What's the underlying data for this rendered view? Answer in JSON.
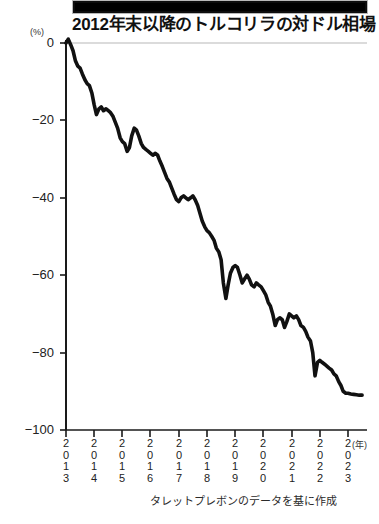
{
  "banner": {
    "name": "black-headline-bar"
  },
  "header": {
    "title": "2012年末以降のトルコリラの対ドル相場"
  },
  "footer": {
    "source_note": "タレットプレボンのデータを基に作成"
  },
  "axis": {
    "unit_label": "(%)",
    "x_unit_label": "(年)"
  },
  "chart_data": {
    "type": "line",
    "title": "2012年末以降のトルコリラの対ドル相場",
    "subtitle": "",
    "xlabel": "(年)",
    "ylabel": "(%)",
    "ylim": [
      -100,
      0
    ],
    "xlim": [
      2013,
      2023.6
    ],
    "grid": "zero-line-only",
    "legend": "none",
    "line_color": "#111111",
    "line_width_px": 3.6,
    "y_ticks": [
      0,
      -20,
      -40,
      -60,
      -80,
      -100
    ],
    "y_tick_labels": [
      "0",
      "−20",
      "−40",
      "−60",
      "−80",
      "−100"
    ],
    "x_ticks": [
      2013,
      2014,
      2015,
      2016,
      2017,
      2018,
      2019,
      2020,
      2021,
      2022,
      2023
    ],
    "x_tick_labels": [
      "2013",
      "2014",
      "2015",
      "2016",
      "2017",
      "2018",
      "2019",
      "2020",
      "2021",
      "2022",
      "2023"
    ],
    "series": [
      {
        "name": "トルコリラ対ドル相場（2012年末比）",
        "x": [
          2013.0,
          2013.08,
          2013.17,
          2013.25,
          2013.33,
          2013.42,
          2013.5,
          2013.58,
          2013.67,
          2013.75,
          2013.83,
          2013.92,
          2014.0,
          2014.08,
          2014.17,
          2014.25,
          2014.33,
          2014.42,
          2014.5,
          2014.58,
          2014.67,
          2014.75,
          2014.83,
          2014.92,
          2015.0,
          2015.08,
          2015.17,
          2015.25,
          2015.33,
          2015.42,
          2015.5,
          2015.58,
          2015.67,
          2015.75,
          2015.83,
          2015.92,
          2016.0,
          2016.08,
          2016.17,
          2016.25,
          2016.33,
          2016.42,
          2016.5,
          2016.58,
          2016.67,
          2016.75,
          2016.83,
          2016.92,
          2017.0,
          2017.08,
          2017.17,
          2017.25,
          2017.33,
          2017.42,
          2017.5,
          2017.58,
          2017.67,
          2017.75,
          2017.83,
          2017.92,
          2018.0,
          2018.08,
          2018.17,
          2018.25,
          2018.33,
          2018.42,
          2018.5,
          2018.58,
          2018.67,
          2018.75,
          2018.83,
          2018.92,
          2019.0,
          2019.08,
          2019.17,
          2019.25,
          2019.33,
          2019.42,
          2019.5,
          2019.58,
          2019.67,
          2019.75,
          2019.83,
          2019.92,
          2020.0,
          2020.08,
          2020.17,
          2020.25,
          2020.33,
          2020.42,
          2020.5,
          2020.58,
          2020.67,
          2020.75,
          2020.83,
          2020.92,
          2021.0,
          2021.08,
          2021.17,
          2021.25,
          2021.33,
          2021.42,
          2021.5,
          2021.58,
          2021.67,
          2021.75,
          2021.83,
          2021.92,
          2022.0,
          2022.08,
          2022.17,
          2022.25,
          2022.33,
          2022.42,
          2022.5,
          2022.58,
          2022.67,
          2022.75,
          2022.83,
          2022.92,
          2023.0,
          2023.1,
          2023.2,
          2023.3,
          2023.4,
          2023.5
        ],
        "values": [
          0.0,
          1.0,
          -0.5,
          -2.0,
          -4.5,
          -6.0,
          -6.5,
          -8.0,
          -9.5,
          -10.5,
          -11.0,
          -13.0,
          -16.0,
          -18.5,
          -17.0,
          -16.5,
          -17.5,
          -17.0,
          -17.5,
          -18.0,
          -19.0,
          -20.5,
          -22.0,
          -24.5,
          -25.5,
          -26.0,
          -28.0,
          -27.0,
          -24.0,
          -22.0,
          -22.5,
          -24.0,
          -26.0,
          -27.0,
          -27.5,
          -28.0,
          -28.5,
          -29.0,
          -28.5,
          -29.0,
          -30.5,
          -32.0,
          -33.5,
          -35.0,
          -36.0,
          -37.5,
          -39.0,
          -40.5,
          -41.0,
          -40.0,
          -39.5,
          -40.0,
          -40.5,
          -40.0,
          -39.5,
          -40.5,
          -42.0,
          -44.0,
          -46.0,
          -47.5,
          -48.5,
          -49.0,
          -50.0,
          -51.0,
          -53.0,
          -54.0,
          -56.0,
          -62.0,
          -66.0,
          -62.5,
          -59.5,
          -58.0,
          -57.5,
          -58.0,
          -60.0,
          -62.0,
          -61.0,
          -60.0,
          -61.0,
          -62.5,
          -63.0,
          -62.0,
          -62.5,
          -63.0,
          -64.0,
          -65.0,
          -67.0,
          -68.0,
          -70.0,
          -73.0,
          -71.5,
          -71.0,
          -71.5,
          -73.5,
          -72.0,
          -70.0,
          -70.5,
          -71.0,
          -70.5,
          -71.5,
          -73.0,
          -73.5,
          -74.5,
          -76.0,
          -77.0,
          -80.0,
          -86.0,
          -82.5,
          -82.0,
          -82.5,
          -83.0,
          -83.5,
          -84.0,
          -84.5,
          -85.5,
          -86.0,
          -87.5,
          -88.5,
          -90.0,
          -90.5,
          -90.5,
          -90.7,
          -90.8,
          -90.9,
          -91.0,
          -91.0
        ]
      }
    ],
    "annotations": [
      {
        "text": "0",
        "note": "zero reference line drawn in light gray across plot"
      }
    ],
    "source": "タレットプレボンのデータを基に作成"
  },
  "ytick_labels": [
    {
      "label": "0",
      "top": 36
    },
    {
      "label": "−20",
      "top": 113
    },
    {
      "label": "−40",
      "top": 191
    },
    {
      "label": "−60",
      "top": 268
    },
    {
      "label": "−80",
      "top": 346
    },
    {
      "label": "−100",
      "top": 423
    }
  ],
  "xtick_labels": [
    {
      "d0": "2",
      "d1": "0",
      "d2": "1",
      "d3": "3",
      "left": 57
    },
    {
      "d0": "2",
      "d1": "0",
      "d2": "1",
      "d3": "4",
      "left": 85
    },
    {
      "d0": "2",
      "d1": "0",
      "d2": "1",
      "d3": "5",
      "left": 113
    },
    {
      "d0": "2",
      "d1": "0",
      "d2": "1",
      "d3": "6",
      "left": 141
    },
    {
      "d0": "2",
      "d1": "0",
      "d2": "1",
      "d3": "7",
      "left": 170
    },
    {
      "d0": "2",
      "d1": "0",
      "d2": "1",
      "d3": "8",
      "left": 198
    },
    {
      "d0": "2",
      "d1": "0",
      "d2": "1",
      "d3": "9",
      "left": 226
    },
    {
      "d0": "2",
      "d1": "0",
      "d2": "2",
      "d3": "0",
      "left": 254
    },
    {
      "d0": "2",
      "d1": "0",
      "d2": "2",
      "d3": "1",
      "left": 283
    },
    {
      "d0": "2",
      "d1": "0",
      "d2": "2",
      "d3": "2",
      "left": 311
    },
    {
      "d0": "2",
      "d1": "0",
      "d2": "2",
      "d3": "3",
      "left": 339
    }
  ]
}
